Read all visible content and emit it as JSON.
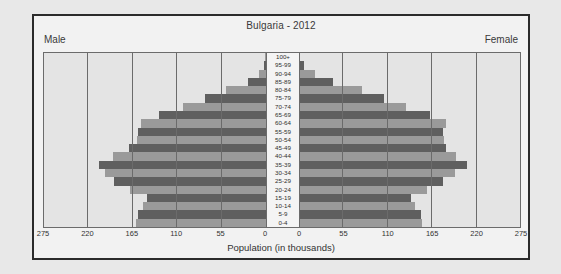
{
  "chart_data": {
    "type": "bar",
    "subtype": "population-pyramid",
    "title": "Bulgaria - 2012",
    "xlabel": "Population (in thousands)",
    "ylabel": "",
    "left_series_label": "Male",
    "right_series_label": "Female",
    "xlim": [
      0,
      275
    ],
    "xticks": [
      275,
      220,
      165,
      110,
      55,
      0
    ],
    "xticks_right": [
      0,
      55,
      110,
      165,
      220,
      275
    ],
    "grid": true,
    "legend": "none",
    "categories": [
      "100+",
      "95-99",
      "90-94",
      "85-89",
      "80-84",
      "75-79",
      "70-74",
      "65-69",
      "60-64",
      "55-59",
      "50-54",
      "45-49",
      "40-44",
      "35-39",
      "30-34",
      "25-29",
      "20-24",
      "15-19",
      "10-14",
      "5-9",
      "0-4"
    ],
    "series": [
      {
        "name": "Male",
        "side": "left",
        "values": [
          1,
          3,
          9,
          22,
          50,
          75,
          103,
          133,
          155,
          158,
          160,
          170,
          189,
          207,
          199,
          188,
          169,
          148,
          152,
          159,
          161
        ]
      },
      {
        "name": "Female",
        "side": "right",
        "values": [
          2,
          8,
          21,
          43,
          79,
          106,
          134,
          163,
          183,
          180,
          181,
          183,
          196,
          209,
          194,
          180,
          160,
          140,
          145,
          152,
          153
        ]
      }
    ],
    "colors": {
      "bar_dark": "#5f5f5f",
      "bar_light": "#9a9a9a",
      "plot_background": "#e4e4e4",
      "center_background": "#f4f4f4",
      "frame_background": "#f2f2f2",
      "page_background": "#e8e8e8",
      "border": "#2b2b2b",
      "gridline": "#6b6b6b"
    }
  }
}
